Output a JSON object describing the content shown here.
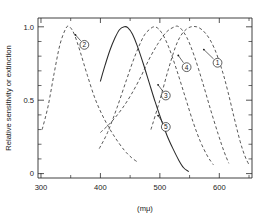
{
  "figure": {
    "name": "spectral-sensitivity-figure",
    "background": "#ffffff",
    "ink": "#2a2a2a"
  },
  "chart_data": {
    "type": "line",
    "title": "",
    "subtitle": "",
    "xlabel": "(mμ)",
    "ylabel": "Relative sensitivity or extinction",
    "xlim": [
      295,
      655
    ],
    "ylim": [
      -0.03,
      1.06
    ],
    "grid": false,
    "legend": "none",
    "legend_style": "circled-number-callouts-on-curves",
    "x_major_ticks": [
      300,
      400,
      500,
      600
    ],
    "x_major_tick_labels": [
      "300",
      "400",
      "500",
      "600"
    ],
    "x_minor_ticks": [
      350,
      450,
      550,
      650
    ],
    "y_major_ticks": [
      0,
      0.5,
      1.0
    ],
    "y_major_tick_labels": [
      "0",
      "0.5",
      "1.0"
    ],
    "y_minor_ticks": [
      0.1,
      0.2,
      0.3,
      0.4,
      0.6,
      0.7,
      0.8,
      0.9
    ],
    "axis_units": "millimicrons",
    "series": [
      {
        "name": "curve-1",
        "label": "1",
        "style": "dashed",
        "peak_x": 562,
        "peak_y": 1.0,
        "x": [
          485,
          500,
          515,
          530,
          545,
          562,
          578,
          592,
          605,
          615,
          625,
          635,
          643,
          650
        ],
        "y": [
          0.3,
          0.5,
          0.72,
          0.9,
          0.985,
          1.0,
          0.95,
          0.85,
          0.7,
          0.55,
          0.38,
          0.22,
          0.12,
          0.06
        ]
      },
      {
        "name": "curve-2",
        "label": "2",
        "style": "dashed",
        "peak_x": 345,
        "peak_y": 1.0,
        "x": [
          302,
          312,
          322,
          332,
          342,
          348,
          356,
          366,
          378,
          392,
          408,
          424,
          440,
          452,
          462
        ],
        "y": [
          0.3,
          0.46,
          0.68,
          0.88,
          0.99,
          1.0,
          0.95,
          0.83,
          0.67,
          0.5,
          0.36,
          0.25,
          0.16,
          0.11,
          0.08
        ]
      },
      {
        "name": "curve-3",
        "label": "3",
        "style": "dashed",
        "peak_x": 490,
        "peak_y": 1.0,
        "x": [
          398,
          412,
          428,
          444,
          458,
          472,
          482,
          492,
          503,
          515,
          528,
          542,
          556,
          568,
          580,
          590
        ],
        "y": [
          0.17,
          0.28,
          0.45,
          0.64,
          0.8,
          0.93,
          0.98,
          1.0,
          0.96,
          0.86,
          0.71,
          0.53,
          0.35,
          0.22,
          0.12,
          0.06
        ]
      },
      {
        "name": "curve-4",
        "label": "4",
        "style": "dashed",
        "peak_x": 528,
        "peak_y": 1.0,
        "x": [
          400,
          418,
          436,
          452,
          468,
          482,
          496,
          510,
          522,
          532,
          545,
          558,
          572,
          585,
          598,
          608,
          616
        ],
        "y": [
          0.28,
          0.35,
          0.44,
          0.54,
          0.66,
          0.78,
          0.88,
          0.96,
          0.995,
          1.0,
          0.93,
          0.8,
          0.62,
          0.44,
          0.27,
          0.15,
          0.07
        ]
      },
      {
        "name": "curve-5",
        "label": "5",
        "style": "solid",
        "peak_x": 443,
        "peak_y": 1.0,
        "x": [
          400,
          408,
          416,
          424,
          432,
          440,
          446,
          454,
          462,
          472,
          482,
          492,
          502,
          512,
          522,
          532,
          540,
          548
        ],
        "y": [
          0.63,
          0.74,
          0.84,
          0.92,
          0.98,
          1.0,
          0.995,
          0.95,
          0.87,
          0.75,
          0.62,
          0.49,
          0.37,
          0.26,
          0.17,
          0.09,
          0.04,
          0.015
        ]
      }
    ],
    "callouts": [
      {
        "label": "1",
        "anchor_x": 574,
        "anchor_y": 0.845,
        "badge_x": 597,
        "badge_y": 0.755
      },
      {
        "label": "2",
        "anchor_x": 358,
        "anchor_y": 0.945,
        "badge_x": 373,
        "badge_y": 0.877
      },
      {
        "label": "3",
        "anchor_x": 497,
        "anchor_y": 0.605,
        "badge_x": 510,
        "badge_y": 0.532
      },
      {
        "label": "4",
        "anchor_x": 531,
        "anchor_y": 0.805,
        "badge_x": 545,
        "badge_y": 0.725
      },
      {
        "label": "5",
        "anchor_x": 497,
        "anchor_y": 0.395,
        "badge_x": 510,
        "badge_y": 0.318
      }
    ]
  }
}
